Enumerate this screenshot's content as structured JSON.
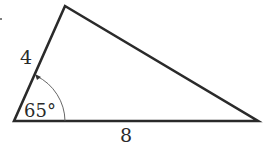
{
  "diagram": {
    "type": "triangle",
    "vertices": {
      "bottom_left": [
        14,
        121
      ],
      "top": [
        65,
        6
      ],
      "right": [
        258,
        121
      ]
    },
    "labels": {
      "left_side": "4",
      "base": "8",
      "angle": "65°"
    },
    "colors": {
      "stroke": "#2a2a2a",
      "background": "#ffffff"
    }
  }
}
